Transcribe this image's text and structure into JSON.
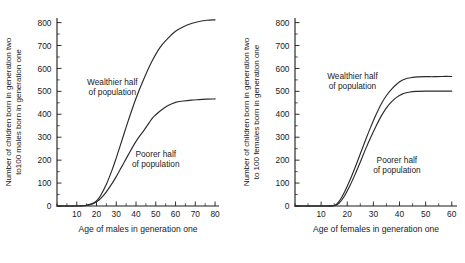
{
  "figure": {
    "background": "#ffffff",
    "line_color": "#2a2a2a",
    "footer_fragment": "_____ _____ ___ ____ __ ____ ____ __ ___ ____ ___ __ ___ __"
  },
  "chart_data": [
    {
      "type": "line",
      "panel": "left",
      "title": "",
      "xlabel": "Age of males in generation one",
      "ylabel": "Number of children born in generation two to100 males born in generation one",
      "ylabel_line1": "Number of children born in generation two",
      "ylabel_line2": "to100 males born in generation one",
      "xlim": [
        0,
        82
      ],
      "ylim": [
        0,
        820
      ],
      "xticks": [
        10,
        20,
        30,
        40,
        50,
        60,
        70,
        80
      ],
      "xticklabels": [
        "10",
        "20",
        "30",
        "40",
        "50",
        "60",
        "70",
        "80"
      ],
      "yticks": [
        0,
        100,
        200,
        300,
        400,
        500,
        600,
        700,
        800
      ],
      "yticklabels": [
        "0",
        "100",
        "200",
        "300",
        "400",
        "500",
        "600",
        "700",
        "800"
      ],
      "y_minor_interval": 50,
      "x_minor_interval": 5,
      "grid": false,
      "legend": "in-plot annotations",
      "series": [
        {
          "name": "Wealthier half of population",
          "annotation_line1": "Wealthier half",
          "annotation_line2": "of population",
          "x": [
            0,
            10,
            14,
            16,
            18,
            20,
            22,
            25,
            28,
            30,
            33,
            36,
            40,
            44,
            48,
            52,
            56,
            60,
            64,
            68,
            72,
            76,
            80
          ],
          "y": [
            0,
            0,
            2,
            6,
            12,
            22,
            45,
            95,
            160,
            210,
            290,
            370,
            470,
            555,
            630,
            690,
            730,
            762,
            782,
            796,
            805,
            810,
            812
          ]
        },
        {
          "name": "Poorer half of population",
          "annotation_line1": "Poorer half",
          "annotation_line2": "of population",
          "x": [
            0,
            10,
            14,
            16,
            18,
            20,
            22,
            25,
            28,
            30,
            33,
            36,
            40,
            44,
            48,
            50,
            53,
            56,
            60,
            64,
            68,
            72,
            76,
            80
          ],
          "y": [
            0,
            0,
            1,
            4,
            9,
            18,
            32,
            62,
            100,
            128,
            175,
            222,
            282,
            330,
            380,
            398,
            420,
            437,
            452,
            458,
            462,
            464,
            466,
            467
          ]
        }
      ]
    },
    {
      "type": "line",
      "panel": "right",
      "title": "",
      "xlabel": "Age of females in generation one",
      "ylabel": "Number of children born in generation two to 100 females born in generation one",
      "ylabel_line1": "Number of children born in generation two",
      "ylabel_line2": "to 100 females born in generation one",
      "xlim": [
        0,
        62
      ],
      "ylim": [
        0,
        820
      ],
      "xticks": [
        10,
        20,
        30,
        40,
        50,
        60
      ],
      "xticklabels": [
        "10",
        "20",
        "30",
        "40",
        "50",
        "60"
      ],
      "yticks": [
        0,
        100,
        200,
        300,
        400,
        500,
        600,
        700,
        800
      ],
      "yticklabels": [
        "0",
        "100",
        "200",
        "300",
        "400",
        "500",
        "600",
        "700",
        "800"
      ],
      "y_minor_interval": 50,
      "x_minor_interval": 5,
      "grid": false,
      "legend": "in-plot annotations",
      "series": [
        {
          "name": "Wealthier half of population",
          "annotation_line1": "Wealthier half",
          "annotation_line2": "of population",
          "x": [
            0,
            10,
            15,
            17,
            19,
            21,
            23,
            25,
            27,
            29,
            31,
            33,
            35,
            37,
            39,
            41,
            43,
            45,
            47,
            50,
            53,
            56,
            60
          ],
          "y": [
            0,
            0,
            2,
            22,
            62,
            112,
            168,
            228,
            288,
            345,
            398,
            445,
            482,
            510,
            532,
            548,
            557,
            561,
            563,
            564,
            564,
            565,
            565
          ]
        },
        {
          "name": "Poorer half of population",
          "annotation_line1": "Poorer half",
          "annotation_line2": "of population",
          "x": [
            0,
            10,
            15,
            17,
            19,
            21,
            23,
            25,
            27,
            29,
            31,
            33,
            35,
            37,
            39,
            41,
            43,
            45,
            47,
            50,
            53,
            56,
            60
          ],
          "y": [
            0,
            0,
            1,
            14,
            45,
            88,
            138,
            192,
            248,
            300,
            348,
            392,
            428,
            455,
            475,
            488,
            495,
            499,
            500,
            501,
            501,
            501,
            501
          ]
        }
      ]
    }
  ]
}
